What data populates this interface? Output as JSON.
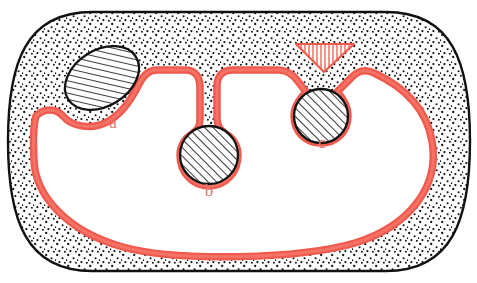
{
  "figure": {
    "type": "anatomical-cross-section-diagram",
    "background_color": "#ffffff"
  },
  "colors": {
    "outline": "#111111",
    "membrane_red": "#f1594c",
    "membrane_red_light": "#f5776b",
    "label_red": "#e4736b",
    "stipple_dot": "#111111",
    "hatch_line": "#1a1a1a",
    "wedge_hatch": "#f1594c",
    "fill_white": "#ffffff"
  },
  "labels": [
    {
      "id": "a",
      "text": "a",
      "x": 113,
      "y": 128,
      "describes": "ellipse-inclusion-a"
    },
    {
      "id": "b",
      "text": "b",
      "x": 209,
      "y": 194,
      "describes": "circle-inclusion-b"
    },
    {
      "id": "c",
      "text": "c",
      "x": 322,
      "y": 145,
      "describes": "circle-inclusion-c"
    }
  ],
  "elements": {
    "outer_capsule": {
      "name": "outer-capsule-outline",
      "description": "stadium / rounded-rectangle organ boundary, black outline"
    },
    "stipple_layer": {
      "name": "stippled-cortex-layer",
      "description": "dotted stippled band between the black outer outline and the red inner membrane"
    },
    "red_membrane": {
      "name": "red-membrane-line",
      "description": "thick salmon-red line tracing the inner cavity, invaginating around inclusions a, b and c"
    },
    "inclusion_a": {
      "name": "ellipse-inclusion-a",
      "shape": "ellipse",
      "cx": 102,
      "cy": 78,
      "rx": 40,
      "ry": 28,
      "rotation": -32,
      "fill": "diagonal-hatch",
      "relation": "embedded in stippled layer, red membrane curves beneath it"
    },
    "inclusion_b": {
      "name": "circle-inclusion-b",
      "shape": "circle",
      "cx": 208,
      "cy": 140,
      "r": 31,
      "fill": "diagonal-hatch",
      "relation": "suspended on a narrow stippled stalk descending from the capsule wall"
    },
    "inclusion_c": {
      "name": "circle-inclusion-c",
      "shape": "circle",
      "cx": 320,
      "cy": 92,
      "r": 28,
      "fill": "diagonal-hatch",
      "relation": "red membrane wraps it; a red vertically-hatched wedge sits above it"
    },
    "hatched_wedge": {
      "name": "red-hatched-wedge",
      "description": "downward-pointing triangular wedge filled with vertical red hatch lines, above inclusion c"
    },
    "stalk_b": {
      "name": "stippled-stalk-b",
      "description": "narrow vertical column of stipple connecting capsule wall to inclusion b"
    }
  }
}
